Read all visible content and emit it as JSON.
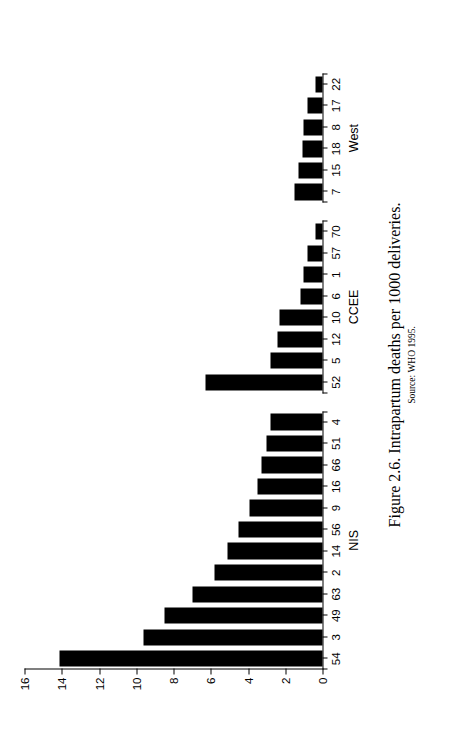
{
  "figure": {
    "caption": "Figure 2.6. Intrapartum deaths per 1000 deliveries.",
    "source": "Source: WHO 1995."
  },
  "chart_data": {
    "type": "bar",
    "orientation": "vertical",
    "title": "Figure 2.6. Intrapartum deaths per 1000 deliveries.",
    "xlabel": "",
    "ylabel": "Number/1 000 births",
    "ylim": [
      0,
      16
    ],
    "ytick_labels": [
      "0",
      "2",
      "4",
      "6",
      "8",
      "10",
      "12",
      "14",
      "16"
    ],
    "ytick_values": [
      0,
      2,
      4,
      6,
      8,
      10,
      12,
      14,
      16
    ],
    "grid": false,
    "legend": false,
    "bar_color": "#000000",
    "groups": [
      {
        "name": "NIS",
        "categories": [
          "54",
          "3",
          "49",
          "63",
          "2",
          "14",
          "56",
          "9",
          "16",
          "66",
          "51",
          "4"
        ],
        "values": [
          14.1,
          9.6,
          8.5,
          7.0,
          5.8,
          5.1,
          4.5,
          3.9,
          3.5,
          3.3,
          3.0,
          2.8
        ]
      },
      {
        "name": "CCEE",
        "categories": [
          "52",
          "5",
          "12",
          "10",
          "6",
          "1",
          "57",
          "70"
        ],
        "values": [
          6.3,
          2.8,
          2.4,
          2.3,
          1.2,
          1.0,
          0.8,
          0.35
        ]
      },
      {
        "name": "West",
        "categories": [
          "7",
          "15",
          "18",
          "8",
          "17",
          "22"
        ],
        "values": [
          1.5,
          1.3,
          1.05,
          1.0,
          0.8,
          0.35
        ]
      }
    ]
  }
}
